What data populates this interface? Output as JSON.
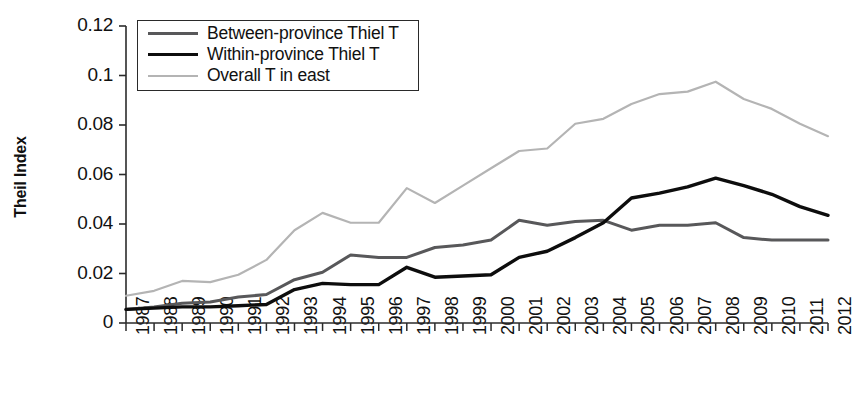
{
  "chart_data": {
    "type": "line",
    "title": "",
    "xlabel": "",
    "ylabel": "Theil Index",
    "ylim": [
      0,
      0.12
    ],
    "ytick_labels": [
      "0",
      "0.02",
      "0.04",
      "0.06",
      "0.08",
      "0.1",
      "0.12"
    ],
    "ytick_values": [
      0,
      0.02,
      0.04,
      0.06,
      0.08,
      0.1,
      0.12
    ],
    "grid": false,
    "legend_position": "top-left-inside",
    "categories": [
      "1987",
      "1988",
      "1989",
      "1990",
      "1991",
      "1992",
      "1993",
      "1994",
      "1995",
      "1996",
      "1997",
      "1998",
      "1999",
      "2000",
      "2001",
      "2002",
      "2003",
      "2004",
      "2005",
      "2006",
      "2007",
      "2008",
      "2009",
      "2010",
      "2011",
      "2012"
    ],
    "x": [
      1987,
      1988,
      1989,
      1990,
      1991,
      1992,
      1993,
      1994,
      1995,
      1996,
      1997,
      1998,
      1999,
      2000,
      2001,
      2002,
      2003,
      2004,
      2005,
      2006,
      2007,
      2008,
      2009,
      2010,
      2011,
      2012
    ],
    "series": [
      {
        "name": "Between-province Thiel T",
        "color": "#58585a",
        "width": 3.0,
        "values": [
          0.0055,
          0.0065,
          0.008,
          0.0085,
          0.0105,
          0.0115,
          0.0175,
          0.0205,
          0.0275,
          0.0265,
          0.0265,
          0.0305,
          0.0315,
          0.0335,
          0.0415,
          0.0395,
          0.041,
          0.0415,
          0.0375,
          0.0395,
          0.0395,
          0.0405,
          0.0345,
          0.0335,
          0.0335,
          0.0335
        ]
      },
      {
        "name": "Within-province Thiel T",
        "color": "#0d0d0d",
        "width": 3.4,
        "values": [
          0.0055,
          0.006,
          0.0065,
          0.0065,
          0.007,
          0.0075,
          0.0135,
          0.016,
          0.0155,
          0.0155,
          0.0225,
          0.0185,
          0.019,
          0.0195,
          0.0265,
          0.029,
          0.0345,
          0.0405,
          0.0505,
          0.0525,
          0.055,
          0.0585,
          0.0555,
          0.052,
          0.047,
          0.0435
        ]
      },
      {
        "name": "Overall T in east",
        "color": "#b4b4b4",
        "width": 2.2,
        "values": [
          0.011,
          0.013,
          0.017,
          0.0165,
          0.0195,
          0.0255,
          0.0375,
          0.0445,
          0.0405,
          0.0405,
          0.0545,
          0.0485,
          0.0555,
          0.0625,
          0.0695,
          0.0705,
          0.0805,
          0.0825,
          0.0885,
          0.0925,
          0.0935,
          0.0975,
          0.0905,
          0.0865,
          0.0805,
          0.0755
        ]
      }
    ]
  },
  "legend": {
    "items": [
      {
        "label": "Between-province Thiel T"
      },
      {
        "label": "Within-province Thiel T"
      },
      {
        "label": "Overall T in east"
      }
    ]
  }
}
